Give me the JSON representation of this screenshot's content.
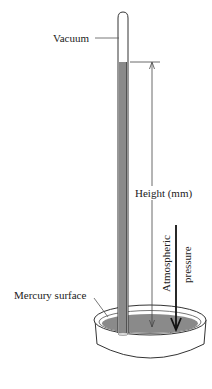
{
  "labels": {
    "vacuum": "Vacuum",
    "height": "Height (mm)",
    "atmospheric_line1": "Atmospheric",
    "atmospheric_line2": "pressure",
    "mercury_surface": "Mercury surface"
  },
  "colors": {
    "mercury": "#8a8a8a",
    "outline": "#333333",
    "background": "#ffffff"
  }
}
